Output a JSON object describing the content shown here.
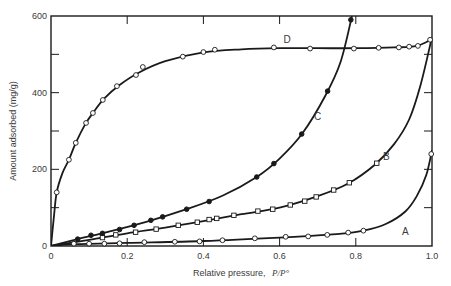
{
  "chart_data": {
    "type": "line",
    "title": "",
    "xlabel": "Relative pressure,",
    "xlabel_italic": "P/P°",
    "ylabel": "Amount adsorbed (mg/g)",
    "xlim": [
      0,
      1.0
    ],
    "ylim": [
      0,
      600
    ],
    "x_ticks": [
      0,
      0.2,
      0.4,
      0.6,
      0.8,
      1.0
    ],
    "x_tick_labels": [
      "0",
      "0.2",
      "0.4",
      "0.6",
      "0.8",
      "1.0"
    ],
    "y_ticks": [
      0,
      200,
      400,
      600
    ],
    "y_tick_labels": [
      "0",
      "200",
      "400",
      "600"
    ],
    "y_minor_ticks": [
      100,
      300,
      500
    ],
    "x_minor_ticks": [],
    "grid": false,
    "legend": "inline curve labels",
    "series": [
      {
        "name": "A",
        "marker": "open-circle",
        "label_pos": [
          0.93,
          30
        ],
        "points": [
          [
            0.06,
            6
          ],
          [
            0.1,
            6
          ],
          [
            0.14,
            6
          ],
          [
            0.18,
            7
          ],
          [
            0.245,
            10
          ],
          [
            0.325,
            11
          ],
          [
            0.39,
            12
          ],
          [
            0.45,
            15
          ],
          [
            0.535,
            20
          ],
          [
            0.616,
            24
          ],
          [
            0.675,
            25
          ],
          [
            0.725,
            29
          ],
          [
            0.78,
            35
          ],
          [
            0.82,
            40
          ],
          [
            0.998,
            240
          ]
        ],
        "curve": [
          [
            0,
            0
          ],
          [
            0.05,
            4
          ],
          [
            0.2,
            8
          ],
          [
            0.4,
            13
          ],
          [
            0.6,
            22
          ],
          [
            0.75,
            31
          ],
          [
            0.82,
            40
          ],
          [
            0.88,
            58
          ],
          [
            0.93,
            90
          ],
          [
            0.96,
            130
          ],
          [
            0.985,
            185
          ],
          [
            1.0,
            250
          ]
        ]
      },
      {
        "name": "B",
        "marker": "open-square",
        "label_pos": [
          0.88,
          225
        ],
        "points": [
          [
            0.135,
            22
          ],
          [
            0.17,
            29
          ],
          [
            0.222,
            36
          ],
          [
            0.276,
            44
          ],
          [
            0.334,
            54
          ],
          [
            0.384,
            62
          ],
          [
            0.415,
            69
          ],
          [
            0.435,
            72
          ],
          [
            0.48,
            80
          ],
          [
            0.543,
            91
          ],
          [
            0.582,
            96
          ],
          [
            0.628,
            107
          ],
          [
            0.666,
            117
          ],
          [
            0.696,
            128
          ],
          [
            0.742,
            146
          ],
          [
            0.783,
            165
          ],
          [
            0.855,
            216
          ]
        ],
        "curve": [
          [
            0,
            0
          ],
          [
            0.1,
            16
          ],
          [
            0.2,
            33
          ],
          [
            0.3,
            48
          ],
          [
            0.4,
            65
          ],
          [
            0.5,
            83
          ],
          [
            0.6,
            100
          ],
          [
            0.7,
            130
          ],
          [
            0.78,
            163
          ],
          [
            0.85,
            212
          ],
          [
            0.9,
            265
          ],
          [
            0.94,
            330
          ],
          [
            0.97,
            420
          ],
          [
            1.0,
            545
          ]
        ]
      },
      {
        "name": "C",
        "marker": "filled-circle",
        "label_pos": [
          0.7,
          330
        ],
        "points": [
          [
            0.07,
            18
          ],
          [
            0.105,
            28
          ],
          [
            0.135,
            33
          ],
          [
            0.18,
            43
          ],
          [
            0.218,
            54
          ],
          [
            0.262,
            67
          ],
          [
            0.293,
            76
          ],
          [
            0.356,
            96
          ],
          [
            0.415,
            116
          ],
          [
            0.54,
            180
          ],
          [
            0.585,
            215
          ],
          [
            0.658,
            292
          ],
          [
            0.726,
            404
          ],
          [
            0.787,
            590
          ]
        ],
        "curve": [
          [
            0,
            0
          ],
          [
            0.07,
            18
          ],
          [
            0.15,
            37
          ],
          [
            0.25,
            63
          ],
          [
            0.35,
            94
          ],
          [
            0.45,
            131
          ],
          [
            0.54,
            180
          ],
          [
            0.6,
            228
          ],
          [
            0.66,
            294
          ],
          [
            0.72,
            392
          ],
          [
            0.76,
            480
          ],
          [
            0.79,
            600
          ]
        ]
      },
      {
        "name": "D",
        "marker": "open-circle",
        "label_pos": [
          0.62,
          530
        ],
        "points": [
          [
            0.015,
            140
          ],
          [
            0.047,
            225
          ],
          [
            0.065,
            269
          ],
          [
            0.092,
            321
          ],
          [
            0.11,
            347
          ],
          [
            0.136,
            381
          ],
          [
            0.173,
            417
          ],
          [
            0.223,
            446
          ],
          [
            0.241,
            467
          ],
          [
            0.346,
            494
          ],
          [
            0.4,
            506
          ],
          [
            0.43,
            512
          ],
          [
            0.585,
            518
          ],
          [
            0.68,
            515
          ],
          [
            0.795,
            515
          ],
          [
            0.86,
            517
          ],
          [
            0.913,
            518
          ],
          [
            0.94,
            520
          ],
          [
            0.963,
            522
          ],
          [
            0.995,
            538
          ]
        ],
        "curve": [
          [
            0,
            0
          ],
          [
            0.008,
            80
          ],
          [
            0.015,
            140
          ],
          [
            0.03,
            190
          ],
          [
            0.047,
            225
          ],
          [
            0.065,
            269
          ],
          [
            0.09,
            318
          ],
          [
            0.11,
            347
          ],
          [
            0.14,
            385
          ],
          [
            0.18,
            420
          ],
          [
            0.23,
            452
          ],
          [
            0.3,
            482
          ],
          [
            0.4,
            505
          ],
          [
            0.5,
            513
          ],
          [
            0.6,
            516
          ],
          [
            0.7,
            516
          ],
          [
            0.8,
            516
          ],
          [
            0.9,
            518
          ],
          [
            0.96,
            522
          ],
          [
            1.0,
            540
          ]
        ]
      }
    ]
  }
}
